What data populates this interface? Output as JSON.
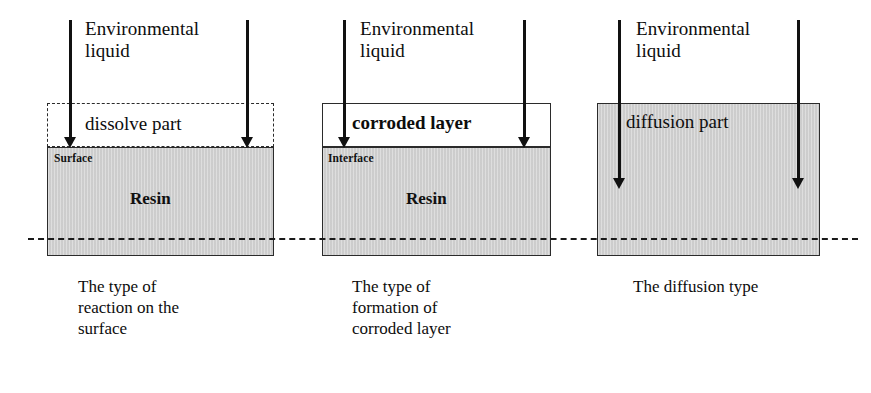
{
  "figure": {
    "baseline_label": "dash-dot reference line",
    "colors": {
      "resin_fill": "#d2d2d2",
      "outline": "#2b2b2b",
      "arrow": "#111111",
      "background": "#ffffff"
    }
  },
  "panels": [
    {
      "id": "reaction-on-surface",
      "inflow_label": "Environmental\nliquid",
      "upper_region_label": "dissolve part",
      "upper_region_border": "dashed",
      "interface_label": "Surface",
      "substrate_label": "Resin",
      "caption": "The type of\nreaction on the\nsurface",
      "arrow_depth": "stops at surface"
    },
    {
      "id": "formation-of-corroded-layer",
      "inflow_label": "Environmental\nliquid",
      "upper_region_label": "corroded layer",
      "upper_region_border": "solid",
      "interface_label": "Interface",
      "substrate_label": "Resin",
      "caption": "The type of\nformation of\ncorroded layer",
      "arrow_depth": "stops at interface"
    },
    {
      "id": "diffusion",
      "inflow_label": "Environmental\nliquid",
      "upper_region_label": "diffusion part",
      "upper_region_border": "none",
      "interface_label": "",
      "substrate_label": "",
      "caption": "The diffusion type",
      "arrow_depth": "penetrates into bulk"
    }
  ]
}
